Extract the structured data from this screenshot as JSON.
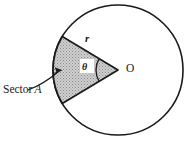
{
  "figure": {
    "type": "geometry-diagram",
    "background_color": "#ffffff",
    "stroke_color": "#1a1a1a",
    "sector_fill_color": "#b9b9b9",
    "labels": {
      "sector_text": "Sector",
      "sector_variable": "A",
      "radius": "r",
      "angle": "θ",
      "center": "O"
    },
    "geometry": {
      "circle_center_x": 118,
      "circle_center_y": 70,
      "circle_radius": 65,
      "sector_vertex_x": 118,
      "sector_vertex_y": 70,
      "sector_start_angle_deg": 149,
      "sector_end_angle_deg": 211,
      "angle_arc_radius": 22,
      "pointer_from_x": 28,
      "pointer_from_y": 90,
      "pointer_to_x": 62,
      "pointer_to_y": 70
    }
  }
}
